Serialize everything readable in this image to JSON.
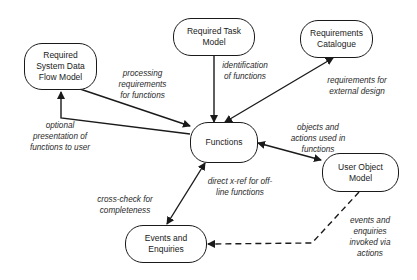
{
  "nodes": {
    "sdfm": "Required\nSystem Data\nFlow Model",
    "task": "Required Task\nModel",
    "catalogue": "Requirements\nCatalogue",
    "functions": "Functions",
    "uom": "User Object\nModel",
    "events": "Events and\nEnquiries"
  },
  "edges": {
    "processing": "processing\nrequirements\nfor functions",
    "identification": "identification\nof functions",
    "external_design": "requirements for\nexternal design",
    "optional": "optional\npresentation of\nfunctions to user",
    "objects_actions": "objects and\nactions used in\nfunctions",
    "xref": "direct x-ref for off-\nline functions",
    "crosscheck": "cross-check for\ncompleteness",
    "events_invoked": "events and\nenquiries\ninvoked via\nactions"
  },
  "colors": {
    "line": "#1a1a1a",
    "text": "#2a2a2a",
    "background": "#ffffff"
  }
}
